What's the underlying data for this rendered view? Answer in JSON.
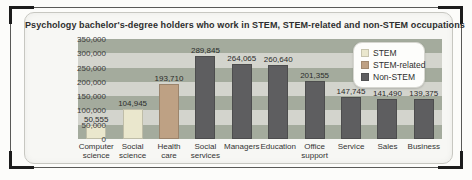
{
  "chart_data": {
    "type": "bar",
    "title": "Psychology bachelor's-degree holders who work in STEM, STEM-related and non-STEM occupations",
    "categories": [
      "Computer\nscience",
      "Social\nscience",
      "Health\ncare",
      "Social\nservices",
      "Managers",
      "Education",
      "Office\nsupport",
      "Service",
      "Sales",
      "Business"
    ],
    "values": [
      50555,
      104945,
      193710,
      289845,
      264065,
      260640,
      201355,
      147745,
      141490,
      139375
    ],
    "value_labels": [
      "50,555",
      "104,945",
      "193,710",
      "289,845",
      "264,065",
      "260,640",
      "201,355",
      "147,745",
      "141,490",
      "139,375"
    ],
    "bar_series": [
      0,
      0,
      1,
      2,
      2,
      2,
      2,
      2,
      2,
      2
    ],
    "legend": [
      {
        "label": "STEM",
        "color": "#eae7cd"
      },
      {
        "label": "STEM-related",
        "color": "#bea184"
      },
      {
        "label": "Non-STEM",
        "color": "#5e5e60"
      }
    ],
    "legend_position": "top-right",
    "ylim": [
      0,
      350000
    ],
    "ytick_step": 50000,
    "yticks": [
      "350,000",
      "300,000",
      "250,000",
      "200,000",
      "150,000",
      "100,000",
      "50,000",
      "0"
    ],
    "grid": "horizontal-bands",
    "band_colors": [
      "#a4ab9d",
      "#d3d4cd"
    ],
    "xlabel": "",
    "ylabel": ""
  }
}
